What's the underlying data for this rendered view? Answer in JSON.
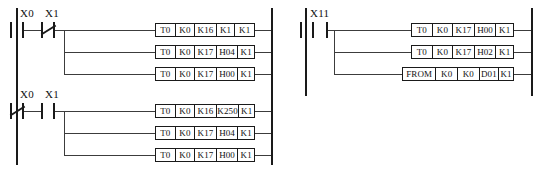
{
  "diagram": {
    "type": "ladder-logic",
    "line_color": "#1a1a1a",
    "background_color": "#ffffff",
    "networks": [
      {
        "id": "network-left",
        "rungs": [
          {
            "id": "rung-1",
            "contacts": [
              {
                "label": "X0",
                "type": "normally-open"
              },
              {
                "label": "X1",
                "type": "normally-closed"
              }
            ],
            "branches": [
              {
                "cells": [
                  "T0",
                  "K0",
                  "K16",
                  "K1",
                  "K1"
                ]
              },
              {
                "cells": [
                  "T0",
                  "K0",
                  "K17",
                  "H04",
                  "K1"
                ]
              },
              {
                "cells": [
                  "T0",
                  "K0",
                  "K17",
                  "H00",
                  "K1"
                ]
              }
            ]
          },
          {
            "id": "rung-2",
            "contacts": [
              {
                "label": "X0",
                "type": "normally-closed"
              },
              {
                "label": "X1",
                "type": "normally-open"
              }
            ],
            "branches": [
              {
                "cells": [
                  "T0",
                  "K0",
                  "K16",
                  "K250",
                  "K1"
                ]
              },
              {
                "cells": [
                  "T0",
                  "K0",
                  "K17",
                  "H04",
                  "K1"
                ]
              },
              {
                "cells": [
                  "T0",
                  "K0",
                  "K17",
                  "H00",
                  "K1"
                ]
              }
            ]
          }
        ]
      },
      {
        "id": "network-right",
        "rungs": [
          {
            "id": "rung-3",
            "contacts": [
              {
                "label": "X11",
                "type": "normally-open"
              }
            ],
            "branches": [
              {
                "cells": [
                  "T0",
                  "K0",
                  "K17",
                  "H00",
                  "K1"
                ]
              },
              {
                "cells": [
                  "T0",
                  "K0",
                  "K17",
                  "H02",
                  "K1"
                ]
              },
              {
                "cells": [
                  "FROM",
                  "K0",
                  "K0",
                  "D01",
                  "K1"
                ]
              }
            ]
          }
        ]
      }
    ]
  }
}
